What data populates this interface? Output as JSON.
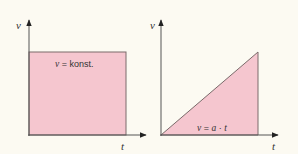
{
  "colors": {
    "background": "#fcfaf2",
    "fill": "#f5c6cf",
    "axis": "#555555",
    "outline": "#7a6a6a",
    "text": "#333333"
  },
  "diagrams": [
    {
      "id": "constant-velocity",
      "y_axis_label": "v",
      "x_axis_label": "t",
      "shape": "rectangle",
      "annotation": {
        "var": "v",
        "rest": " = konst."
      }
    },
    {
      "id": "uniform-acceleration",
      "y_axis_label": "v",
      "x_axis_label": "t",
      "shape": "triangle",
      "annotation": {
        "var": "v",
        "eq": " = ",
        "a": "a",
        "dot": " · ",
        "t": "t"
      }
    }
  ]
}
